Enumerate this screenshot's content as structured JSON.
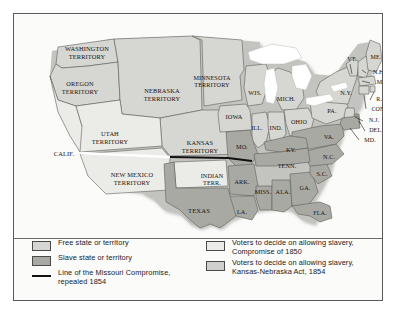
{
  "figure": {
    "kind": "historical-map"
  },
  "map": {
    "labels": [
      {
        "name": "washington-territory",
        "text": "WASHINGTON\nTERRITORY",
        "x": 73,
        "y": 38,
        "size": 6.4
      },
      {
        "name": "oregon-territory",
        "text": "OREGON\nTERRITORY",
        "x": 66,
        "y": 73,
        "size": 6.4
      },
      {
        "name": "utah-territory",
        "text": "UTAH\nTERRITORY",
        "x": 96,
        "y": 123,
        "size": 6.4
      },
      {
        "name": "california",
        "text": "CALIF.",
        "x": 50,
        "y": 140,
        "size": 6.4
      },
      {
        "name": "new-mexico-territory",
        "text": "NEW MEXICO\nTERRITORY",
        "x": 118,
        "y": 164,
        "size": 6.4
      },
      {
        "name": "nebraska-territory",
        "text": "NEBRASKA\nTERRITORY",
        "x": 148,
        "y": 80,
        "size": 6.4
      },
      {
        "name": "minnesota-territory",
        "text": "MINNESOTA\nTERRITORY",
        "x": 198,
        "y": 67,
        "size": 6.2
      },
      {
        "name": "kansas-territory",
        "text": "KANSAS\nTERRITORY",
        "x": 186,
        "y": 132,
        "size": 6.4
      },
      {
        "name": "indian-territory",
        "text": "INDIAN\nTERR.",
        "x": 198,
        "y": 165,
        "size": 6.2
      },
      {
        "name": "texas",
        "text": "TEXAS",
        "x": 185,
        "y": 197,
        "size": 6.6
      },
      {
        "name": "iowa",
        "text": "IOWA",
        "x": 220,
        "y": 103,
        "size": 6.4
      },
      {
        "name": "wisconsin",
        "text": "WIS.",
        "x": 241,
        "y": 79,
        "size": 6.2
      },
      {
        "name": "missouri",
        "text": "MO.",
        "x": 228,
        "y": 133,
        "size": 6.2
      },
      {
        "name": "arkansas",
        "text": "ARK.",
        "x": 228,
        "y": 168,
        "size": 6.2
      },
      {
        "name": "louisiana",
        "text": "LA.",
        "x": 228,
        "y": 198,
        "size": 6.2
      },
      {
        "name": "illinois",
        "text": "ILL.",
        "x": 243,
        "y": 114,
        "size": 6.2
      },
      {
        "name": "indiana",
        "text": "IND.",
        "x": 262,
        "y": 114,
        "size": 6.2
      },
      {
        "name": "michigan",
        "text": "MICH.",
        "x": 272,
        "y": 85,
        "size": 6.2
      },
      {
        "name": "ohio",
        "text": "OHIO",
        "x": 285,
        "y": 108,
        "size": 6.2
      },
      {
        "name": "kentucky",
        "text": "KY.",
        "x": 277,
        "y": 136,
        "size": 6.2
      },
      {
        "name": "tennessee",
        "text": "TENN.",
        "x": 273,
        "y": 152,
        "size": 6.2
      },
      {
        "name": "mississippi",
        "text": "MISS.",
        "x": 249,
        "y": 178,
        "size": 6.2
      },
      {
        "name": "alabama",
        "text": "ALA.",
        "x": 269,
        "y": 178,
        "size": 6.2
      },
      {
        "name": "georgia",
        "text": "GA.",
        "x": 291,
        "y": 174,
        "size": 6.2
      },
      {
        "name": "florida",
        "text": "FLA.",
        "x": 306,
        "y": 199,
        "size": 6.2
      },
      {
        "name": "south-carolina",
        "text": "S.C.",
        "x": 308,
        "y": 160,
        "size": 6.2
      },
      {
        "name": "north-carolina",
        "text": "N.C.",
        "x": 315,
        "y": 143,
        "size": 6.2
      },
      {
        "name": "virginia",
        "text": "VA.",
        "x": 315,
        "y": 123,
        "size": 6.2
      },
      {
        "name": "pennsylvania",
        "text": "PA.",
        "x": 318,
        "y": 97,
        "size": 6.2
      },
      {
        "name": "new-york",
        "text": "N.Y.",
        "x": 332,
        "y": 79,
        "size": 6.2
      },
      {
        "name": "vermont",
        "text": "VT.",
        "x": 338,
        "y": 46,
        "size": 6.0
      },
      {
        "name": "maine",
        "text": "ME.",
        "x": 362,
        "y": 44,
        "size": 6.0
      },
      {
        "name": "new-hampshire",
        "text": "N.H.",
        "x": 365,
        "y": 59,
        "size": 6.0
      },
      {
        "name": "massachusetts",
        "text": "MASS.",
        "x": 372,
        "y": 69,
        "size": 6.0
      },
      {
        "name": "rhode-island",
        "text": "R.I.",
        "x": 367,
        "y": 86,
        "size": 6.0
      },
      {
        "name": "connecticut",
        "text": "CONN.",
        "x": 367,
        "y": 96,
        "size": 6.0
      },
      {
        "name": "new-jersey",
        "text": "N.J.",
        "x": 360,
        "y": 107,
        "size": 6.0
      },
      {
        "name": "delaware",
        "text": "DEL.",
        "x": 362,
        "y": 117,
        "size": 6.0
      },
      {
        "name": "maryland",
        "text": "MD.",
        "x": 356,
        "y": 127,
        "size": 6.0
      }
    ]
  },
  "legend": {
    "items": [
      {
        "name": "legend-free-state",
        "swatch": "swatch-free",
        "lines": [
          "Free state or territory"
        ]
      },
      {
        "name": "legend-slave-state",
        "swatch": "swatch-slave",
        "lines": [
          "Slave state or territory"
        ]
      },
      {
        "name": "legend-missouri-compromise-line",
        "swatch": "rule",
        "lines": [
          "Line of the Missouri Compromise,",
          "repealed 1854"
        ]
      },
      {
        "name": "legend-compromise-1850",
        "swatch": "swatch-c1850",
        "lines": [
          "Voters to decide on allowing slavery,",
          "Compromise of 1850"
        ]
      },
      {
        "name": "legend-kansas-nebraska-act",
        "swatch": "swatch-kn",
        "lines": [
          "Voters to decide on allowing slavery,",
          "Kansas-Nebraska Act, 1854"
        ]
      }
    ]
  },
  "colors": {
    "free_state": "#d6d6d2",
    "slave_state": "#a9a9a4",
    "compromise_1850": "#ebebe7",
    "kansas_nebraska": "#cfcfcb",
    "compromise_line": "#111111",
    "border": "#5a5a5a",
    "water": "#ffffff",
    "paper": "#fbfbfa"
  }
}
